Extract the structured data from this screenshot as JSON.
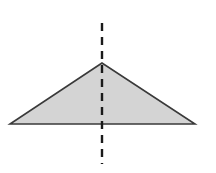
{
  "diagram": {
    "triangle": {
      "apex": [
        102,
        63
      ],
      "base_left": [
        10,
        124
      ],
      "base_right": [
        195,
        124
      ],
      "fill": "#d4d4d4",
      "stroke": "#3a3a3a"
    },
    "symmetry_line": {
      "x": 102,
      "y_start": 23,
      "y_end": 164,
      "stroke": "#1a1a1a",
      "dash": "8,6"
    }
  }
}
